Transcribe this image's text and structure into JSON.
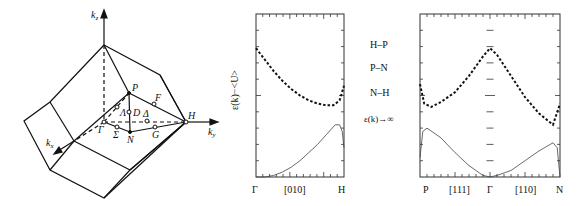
{
  "brillouin_zone": {
    "axes": {
      "kz": "k",
      "kz_sub": "z",
      "ky": "k",
      "ky_sub": "y",
      "kx": "k",
      "kx_sub": "x"
    },
    "points": {
      "Gamma": "Γ",
      "H": "H",
      "P": "P",
      "N": "N"
    },
    "lines": {
      "Lambda": "Λ",
      "Delta": "Δ",
      "Sigma": "Σ",
      "D": "D",
      "F": "F",
      "G": "G"
    }
  },
  "legend": {
    "items": [
      "H–P",
      "P–N",
      "N–H",
      "ε(k)→∞"
    ]
  },
  "chart_data": [
    {
      "type": "line",
      "title": "",
      "ylabel": "ε(k)−<U>",
      "xlabel": "",
      "x_ticks": [
        "Γ",
        "[010]",
        "H"
      ],
      "grid": false,
      "series": [
        {
          "name": "upper (dashed)",
          "style": "dashed",
          "x": [
            0,
            0.1,
            0.2,
            0.3,
            0.4,
            0.5,
            0.6,
            0.7,
            0.8,
            0.88,
            0.95,
            1.0
          ],
          "y": [
            0.79,
            0.72,
            0.65,
            0.59,
            0.54,
            0.5,
            0.47,
            0.45,
            0.44,
            0.44,
            0.47,
            0.56
          ]
        },
        {
          "name": "lower (solid)",
          "style": "solid",
          "x": [
            0,
            0.1,
            0.2,
            0.3,
            0.4,
            0.5,
            0.6,
            0.7,
            0.8,
            0.9,
            0.95,
            0.98,
            1.0
          ],
          "y": [
            0.0,
            0.0,
            0.01,
            0.03,
            0.06,
            0.1,
            0.15,
            0.2,
            0.26,
            0.32,
            0.32,
            0.28,
            0.18
          ]
        }
      ]
    },
    {
      "type": "line",
      "title": "",
      "ylabel": "",
      "xlabel": "",
      "x_ticks": [
        "P",
        "[111]",
        "Γ",
        "[110]",
        "N"
      ],
      "grid": false,
      "series": [
        {
          "name": "upper (dashed)",
          "style": "dashed",
          "x": [
            0,
            0.03,
            0.08,
            0.15,
            0.25,
            0.35,
            0.45,
            0.5,
            0.55,
            0.65,
            0.75,
            0.85,
            0.95,
            1.0
          ],
          "y": [
            0.57,
            0.45,
            0.43,
            0.46,
            0.52,
            0.62,
            0.74,
            0.79,
            0.75,
            0.62,
            0.49,
            0.39,
            0.32,
            0.45
          ]
        },
        {
          "name": "lower (solid)",
          "style": "solid",
          "x": [
            0,
            0.02,
            0.05,
            0.15,
            0.25,
            0.35,
            0.45,
            0.5,
            0.55,
            0.65,
            0.75,
            0.85,
            0.95,
            0.98,
            1.0
          ],
          "y": [
            0.12,
            0.28,
            0.3,
            0.24,
            0.15,
            0.07,
            0.01,
            0.0,
            0.01,
            0.04,
            0.1,
            0.16,
            0.21,
            0.18,
            0.0
          ]
        }
      ]
    }
  ]
}
